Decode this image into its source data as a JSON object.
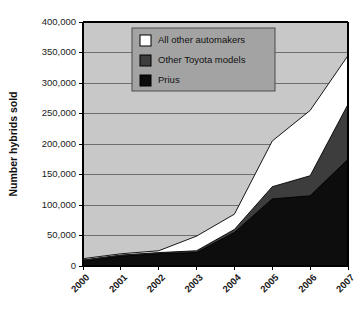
{
  "chart_data": {
    "type": "area",
    "stacked": true,
    "title": "",
    "xlabel": "",
    "ylabel": "Number hybrids sold",
    "categories": [
      "2000",
      "2001",
      "2002",
      "2003",
      "2004",
      "2005",
      "2006",
      "2007"
    ],
    "x": [
      2000,
      2001,
      2002,
      2003,
      2004,
      2005,
      2006,
      2007
    ],
    "ylim": [
      0,
      400000
    ],
    "yticks": [
      0,
      50000,
      100000,
      150000,
      200000,
      250000,
      300000,
      350000,
      400000
    ],
    "ytick_labels": [
      "0",
      "50,000",
      "100,000",
      "150,000",
      "200,000",
      "250,000",
      "300,000",
      "350,000",
      "400,000"
    ],
    "grid": true,
    "grid_axis": "y",
    "legend_position": "top-center-inside",
    "series": [
      {
        "name": "Prius",
        "color": "#0d0d0d",
        "values": [
          8000,
          16000,
          20000,
          22000,
          55000,
          110000,
          115000,
          175000
        ]
      },
      {
        "name": "Other Toyota models",
        "color": "#3d3d3d",
        "values": [
          2000,
          2000,
          2000,
          3000,
          5000,
          20000,
          33000,
          90000
        ]
      },
      {
        "name": "All other automakers",
        "color": "#ffffff",
        "values": [
          2000,
          2000,
          3000,
          24000,
          25000,
          75000,
          107000,
          80000
        ]
      }
    ],
    "cumulative_totals": [
      12000,
      20000,
      25000,
      49000,
      85000,
      205000,
      255000,
      345000
    ],
    "annotations": []
  },
  "legend": {
    "items": [
      {
        "label": "All other automakers",
        "swatch": "#ffffff"
      },
      {
        "label": "Other Toyota models",
        "swatch": "#3d3d3d"
      },
      {
        "label": "Prius",
        "swatch": "#0d0d0d"
      }
    ]
  },
  "colors": {
    "figure_background": "#ffffff",
    "plot_background": "#c8c8c8",
    "legend_background": "#a3a3a3",
    "axis_line": "#000000",
    "grid_line": "#6e6e6e",
    "series_prius": "#0d0d0d",
    "series_other_toyota": "#3d3d3d",
    "series_all_other": "#ffffff"
  },
  "axes": {
    "y_title": "Number hybrids sold",
    "y_tick_labels": [
      "400,000",
      "350,000",
      "300,000",
      "250,000",
      "200,000",
      "150,000",
      "100,000",
      "50,000",
      "0"
    ],
    "x_tick_labels": [
      "2000",
      "2001",
      "2002",
      "2003",
      "2004",
      "2005",
      "2006",
      "2007"
    ]
  }
}
